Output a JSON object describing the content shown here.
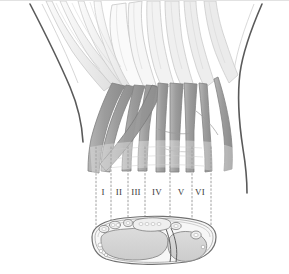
{
  "figure": {
    "width": 289,
    "height": 274,
    "background_color": "#ffffff",
    "top_border_color": "#e2e2e2"
  },
  "palette": {
    "tendon_gray": "#9e9e9e",
    "tendon_gray_dark": "#8a8a8a",
    "tendon_gray_light": "#b4b4b4",
    "muscle_light": "#f2f2f2",
    "outline_dark": "#4a4a4a",
    "outline_mid": "#7d7d7d",
    "outline_light": "#bdbdbd",
    "bone_fill": "#d2d2d2",
    "bone_outline": "#6e6e6e",
    "dotted_line": "#a0a0a0",
    "label_color": "#3a3a3a"
  },
  "compartment_labels": [
    {
      "id": "compartment-1",
      "text": "I",
      "x": 103,
      "y": 192
    },
    {
      "id": "compartment-2",
      "text": "II",
      "x": 119,
      "y": 192
    },
    {
      "id": "compartment-3",
      "text": "III",
      "x": 136,
      "y": 192
    },
    {
      "id": "compartment-4",
      "text": "IV",
      "x": 157,
      "y": 192
    },
    {
      "id": "compartment-5",
      "text": "V",
      "x": 181,
      "y": 192
    },
    {
      "id": "compartment-6",
      "text": "VI",
      "x": 200,
      "y": 192
    }
  ],
  "divider_lines": [
    {
      "id": "divider-0",
      "x": 96,
      "y1": 146,
      "y2": 226
    },
    {
      "id": "divider-1",
      "x": 111,
      "y1": 146,
      "y2": 226
    },
    {
      "id": "divider-2",
      "x": 128,
      "y1": 146,
      "y2": 226
    },
    {
      "id": "divider-3",
      "x": 145,
      "y1": 146,
      "y2": 226
    },
    {
      "id": "divider-4",
      "x": 170,
      "y1": 146,
      "y2": 226
    },
    {
      "id": "divider-5",
      "x": 192,
      "y1": 146,
      "y2": 226
    },
    {
      "id": "divider-6",
      "x": 211,
      "y1": 146,
      "y2": 226
    }
  ],
  "cross_section": {
    "name": "distal-radioulnar-cross-section",
    "radius_label": "radius",
    "ulna_label": "ulna",
    "center_x": 148,
    "center_y": 240
  },
  "forearm_outlines": {
    "left_border_name": "radial-forearm-border",
    "right_border_name": "ulnar-forearm-border"
  }
}
